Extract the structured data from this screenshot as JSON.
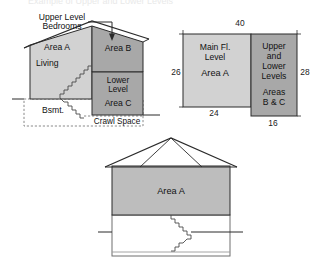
{
  "page": {
    "cropped_title_fragment": "Example of Upper and Lower Levels"
  },
  "colors": {
    "light_fill": "#d2d2d2",
    "dark_fill": "#a8a8a8",
    "line": "#2b2b2b",
    "dashed_line": "#7a7a7a",
    "background": "#ffffff"
  },
  "section_diagram": {
    "name": "house-cross-section",
    "callout": {
      "line1": "Upper Level",
      "line2": "Bedrooms"
    },
    "areas": {
      "area_a_label": "Area A",
      "living_label": "Living",
      "area_b_label": "Area B",
      "lower_level_line1": "Lower",
      "lower_level_line2": "Level",
      "area_c_label": "Area C",
      "basement_label": "Bsmt.",
      "crawl_space_label": "Crawl Space"
    }
  },
  "plan_diagram": {
    "name": "floor-plan",
    "main_block": {
      "line1": "Main Fl.",
      "line2": "Level",
      "line3": "Area A"
    },
    "side_block": {
      "line1": "Upper",
      "line2": "and",
      "line3": "Lower",
      "line4": "Levels",
      "line5": "Areas",
      "line6": "B & C"
    },
    "dimensions": {
      "top": "40",
      "left": "26",
      "right": "28",
      "bottom_left": "24",
      "bottom_right": "16"
    }
  },
  "elevation_diagram": {
    "name": "house-elevation",
    "area_label": "Area A"
  }
}
